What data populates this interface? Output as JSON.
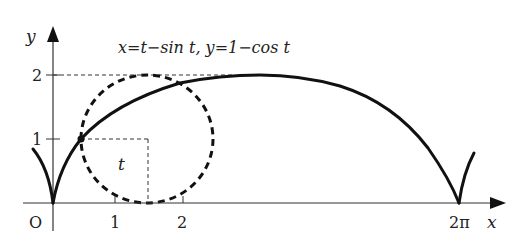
{
  "diagram": {
    "equation": "x=t−sin t, y=1−cos t",
    "axes": {
      "x_label": "x",
      "y_label": "y",
      "origin_label": "O",
      "x_ticks": [
        "1",
        "2"
      ],
      "x_special_tick": "2π",
      "y_ticks": [
        "1",
        "2"
      ]
    },
    "angle_label": "t",
    "colors": {
      "curve": "#111111",
      "axes": "#333333",
      "dashed": "#333333",
      "background": "#ffffff"
    }
  }
}
